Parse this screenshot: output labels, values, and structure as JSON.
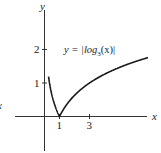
{
  "chart_data": {
    "type": "line",
    "title": "",
    "annotation": "y = |log3(x)|",
    "annotation_parts": {
      "lhs": "y = |log",
      "base": "3",
      "rhs": "(x)|"
    },
    "xlabel": "x",
    "ylabel": "y",
    "left_clipped_label": "x",
    "x_ticks": [
      {
        "value": 1,
        "label": "1"
      },
      {
        "value": 3,
        "label": "3"
      }
    ],
    "y_ticks": [
      {
        "value": 1,
        "label": "1"
      },
      {
        "value": 2,
        "label": "2"
      }
    ],
    "xlim": [
      -1.9,
      6.9
    ],
    "ylim": [
      -1.05,
      3.2
    ],
    "grid": false,
    "legend": "none",
    "series": [
      {
        "name": "y = |log3(x)|",
        "function": "abs(log3(x))",
        "x": [
          0.27,
          0.35,
          0.45,
          0.6,
          0.8,
          1.0,
          1.3,
          1.7,
          2.2,
          3.0,
          3.8,
          4.7,
          5.6,
          6.9
        ],
        "y": [
          1.19,
          0.96,
          0.73,
          0.46,
          0.2,
          0.0,
          0.24,
          0.48,
          0.72,
          1.0,
          1.22,
          1.41,
          1.57,
          1.76
        ]
      }
    ],
    "colors": {
      "curve": "#1a1a1a",
      "axes": "#333333"
    }
  }
}
